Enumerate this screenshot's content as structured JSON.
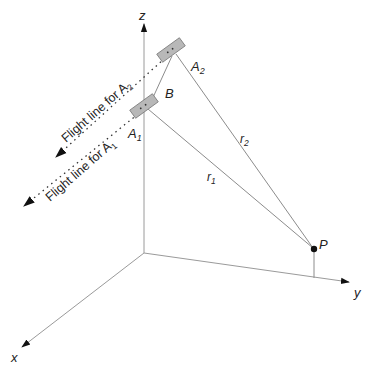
{
  "diagram": {
    "type": "3d-geometry",
    "axes": {
      "x_label": "x",
      "y_label": "y",
      "z_label": "z"
    },
    "points": {
      "A1": {
        "label": "A",
        "sub": "1"
      },
      "A2": {
        "label": "A",
        "sub": "2"
      },
      "B": {
        "label": "B"
      },
      "P": {
        "label": "P"
      }
    },
    "distances": {
      "r1": {
        "label": "r",
        "sub": "1"
      },
      "r2": {
        "label": "r",
        "sub": "2"
      }
    },
    "flight_lines": {
      "a2": {
        "text": "Flight line for A",
        "sub": "2"
      },
      "a1": {
        "text": "Flight line for A",
        "sub": "1"
      }
    },
    "colors": {
      "axis": "#9a9a9a",
      "line": "#8c8c8c",
      "sensor_fill": "#b8b8b8",
      "sensor_stroke": "#7a7a7a",
      "text": "#222222",
      "arrow": "#111111"
    }
  }
}
